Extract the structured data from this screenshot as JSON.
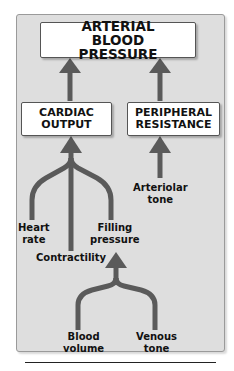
{
  "title_box": {
    "label": "ARTERIAL BLOOD PRESSURE"
  },
  "nodes": {
    "cardiac_output": {
      "label": "CARDIAC OUTPUT"
    },
    "peripheral_resistance": {
      "label": "PERIPHERAL RESISTANCE"
    }
  },
  "factors": {
    "heart_rate": {
      "line1": "Heart",
      "line2": "rate"
    },
    "contractility": {
      "line1": "Contractility"
    },
    "filling_pressure": {
      "line1": "Filling",
      "line2": "pressure"
    },
    "arteriolar_tone": {
      "line1": "Arteriolar",
      "line2": "tone"
    },
    "blood_volume": {
      "line1": "Blood",
      "line2": "volume"
    },
    "venous_tone": {
      "line1": "Venous",
      "line2": "tone"
    }
  },
  "colors": {
    "arrow": "#5a5a5a",
    "panel": "#dedede"
  }
}
